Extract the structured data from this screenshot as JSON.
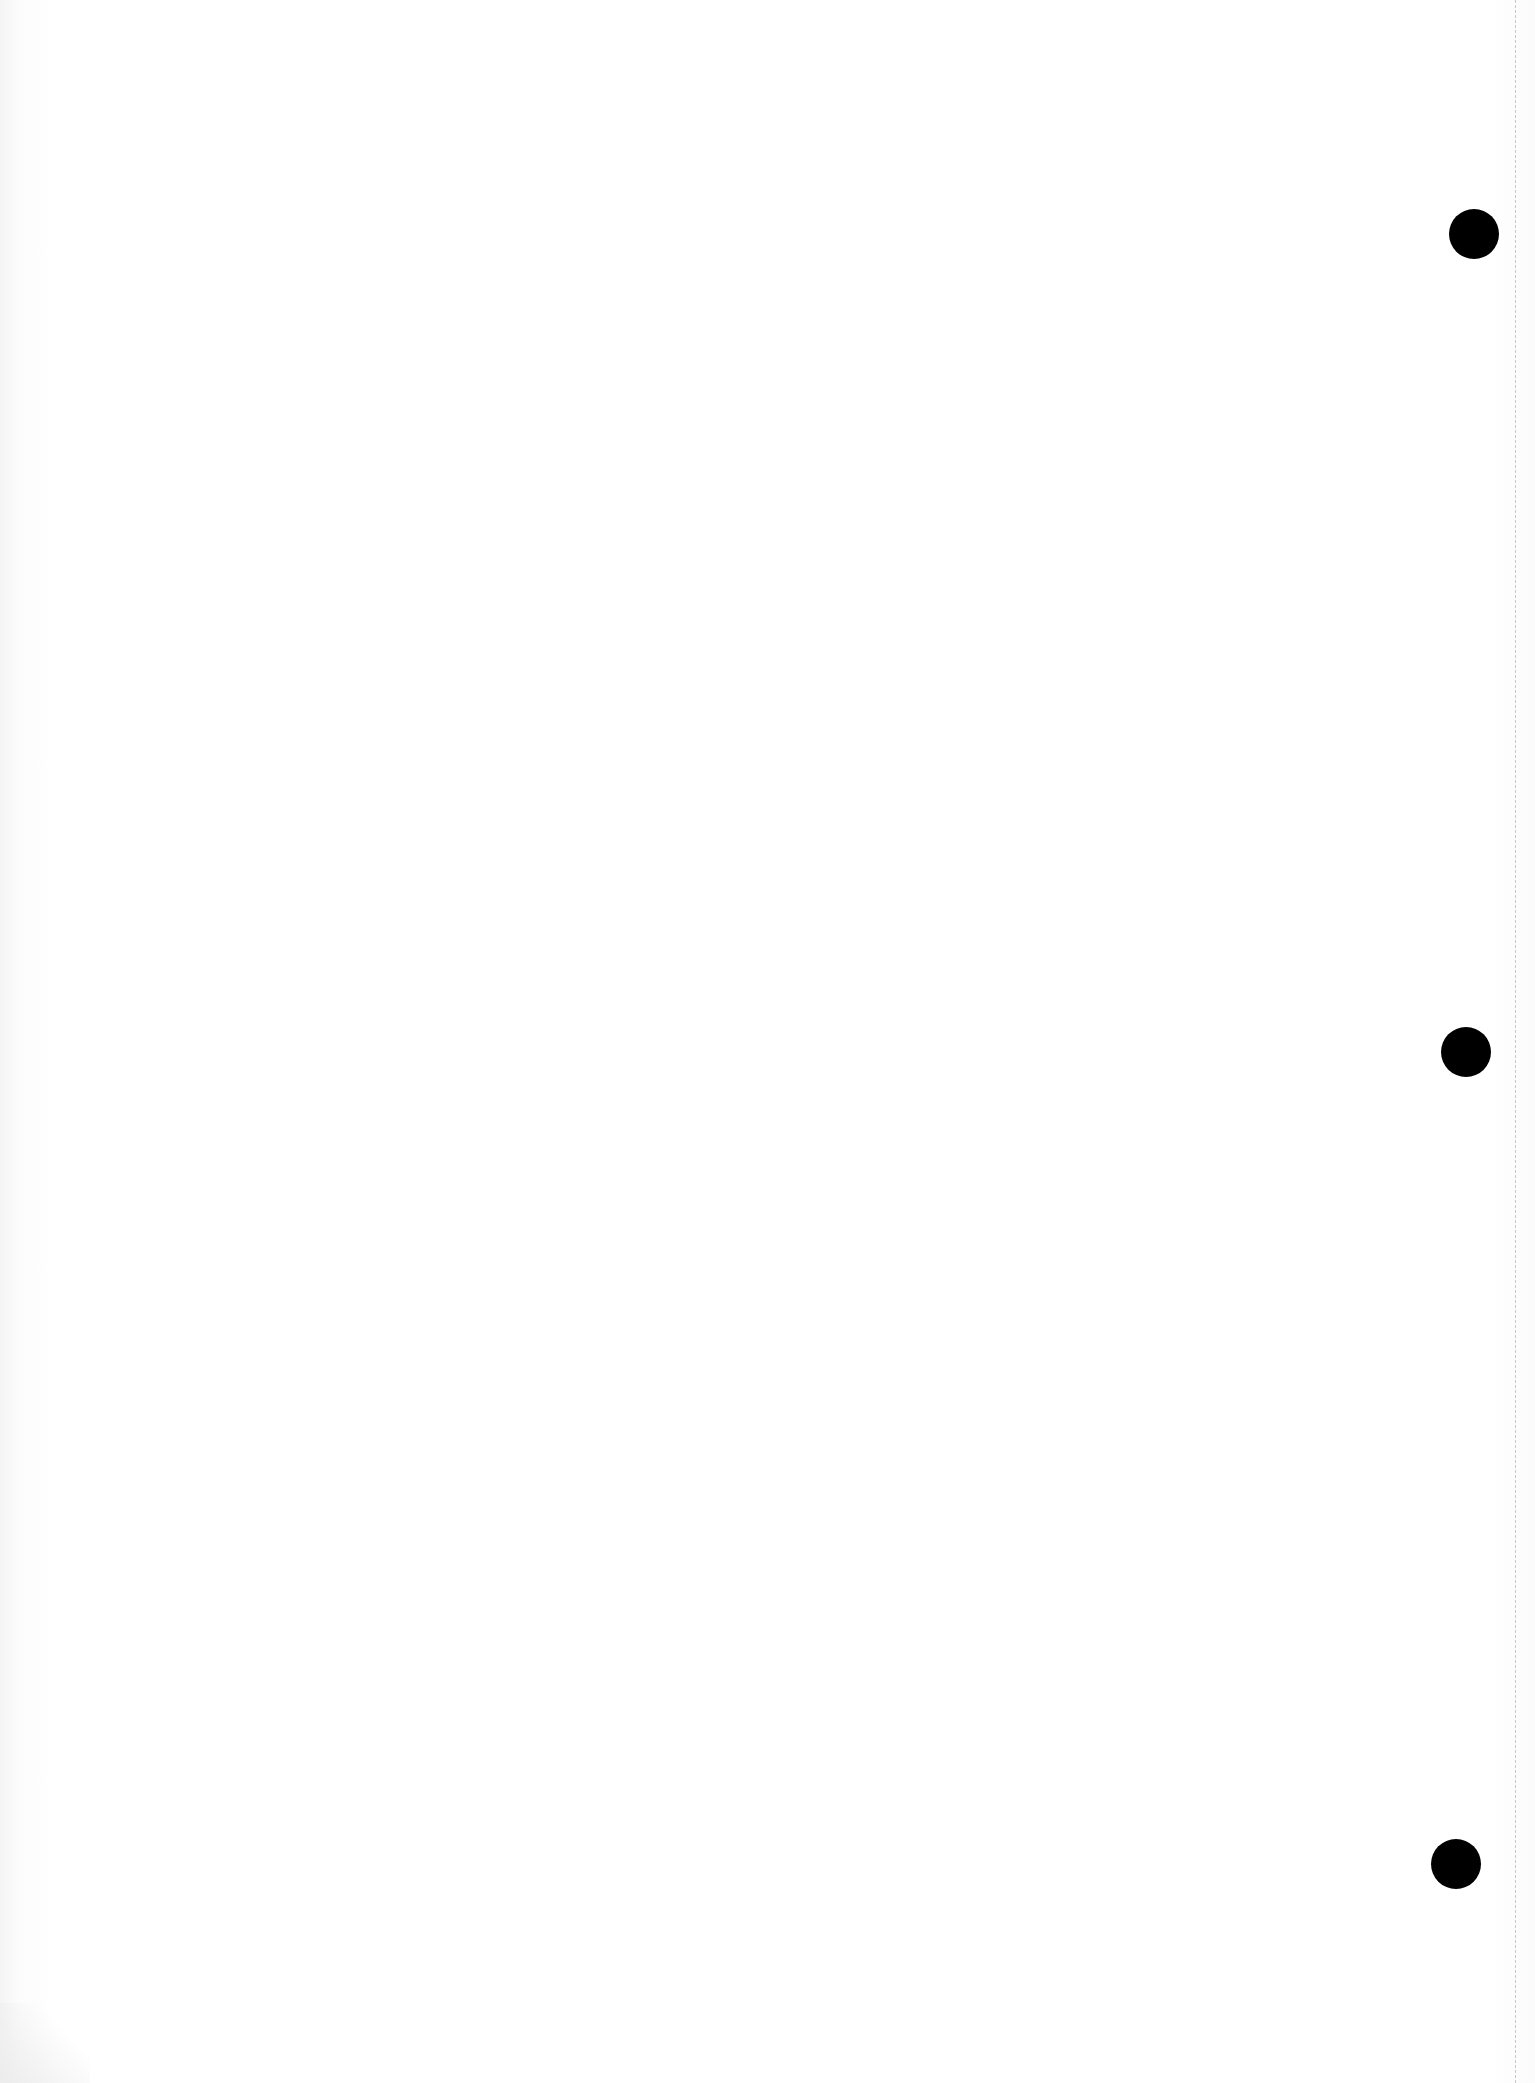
{
  "document": {
    "type": "scanned-blank-page",
    "background_color": "#ffffff",
    "punch_holes": [
      {
        "name": "top",
        "cx": 1474,
        "cy": 234,
        "diameter": 50
      },
      {
        "name": "middle",
        "cx": 1466,
        "cy": 1052,
        "diameter": 50
      },
      {
        "name": "bottom",
        "cx": 1456,
        "cy": 1864,
        "diameter": 50
      }
    ],
    "hole_color": "#000000"
  }
}
